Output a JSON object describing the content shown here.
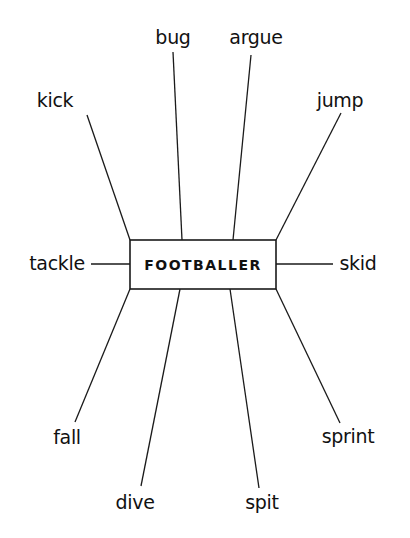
{
  "diagram": {
    "type": "word-web",
    "center": {
      "label": "FOOTBALLER",
      "box": {
        "x1": 130,
        "y1": 240,
        "x2": 276,
        "y2": 289
      }
    },
    "nodes": [
      {
        "id": "kick",
        "label": "kick",
        "pos": [
          55,
          100
        ],
        "line": [
          [
            87,
            115
          ],
          [
            130,
            240
          ]
        ]
      },
      {
        "id": "bug",
        "label": "bug",
        "pos": [
          173,
          37
        ],
        "line": [
          [
            173,
            52
          ],
          [
            182,
            240
          ]
        ]
      },
      {
        "id": "argue",
        "label": "argue",
        "pos": [
          256,
          37
        ],
        "line": [
          [
            251,
            55
          ],
          [
            233,
            240
          ]
        ]
      },
      {
        "id": "jump",
        "label": "jump",
        "pos": [
          340,
          100
        ],
        "line": [
          [
            341,
            113
          ],
          [
            276,
            240
          ]
        ]
      },
      {
        "id": "tackle",
        "label": "tackle",
        "pos": [
          57,
          263
        ],
        "line": [
          [
            91,
            264
          ],
          [
            130,
            264
          ]
        ]
      },
      {
        "id": "skid",
        "label": "skid",
        "pos": [
          358,
          263
        ],
        "line": [
          [
            276,
            264
          ],
          [
            333,
            264
          ]
        ]
      },
      {
        "id": "fall",
        "label": "fall",
        "pos": [
          67,
          437
        ],
        "line": [
          [
            130,
            289
          ],
          [
            75,
            422
          ]
        ]
      },
      {
        "id": "dive",
        "label": "dive",
        "pos": [
          135,
          502
        ],
        "line": [
          [
            180,
            289
          ],
          [
            141,
            486
          ]
        ]
      },
      {
        "id": "spit",
        "label": "spit",
        "pos": [
          262,
          502
        ],
        "line": [
          [
            230,
            289
          ],
          [
            259,
            488
          ]
        ]
      },
      {
        "id": "sprint",
        "label": "sprint",
        "pos": [
          348,
          436
        ],
        "line": [
          [
            276,
            289
          ],
          [
            340,
            423
          ]
        ]
      }
    ],
    "colors": {
      "ink": "#111111",
      "background": "#ffffff"
    }
  }
}
